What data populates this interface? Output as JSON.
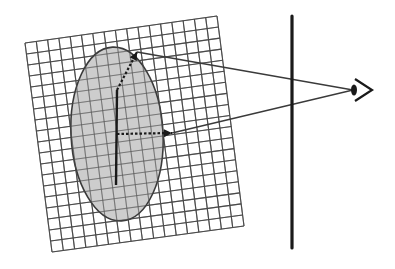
{
  "diagram": {
    "colors": {
      "background": "#ffffff",
      "grid_line": "#4a4a4a",
      "ellipse_fill": "#c4c4c4",
      "ellipse_stroke": "#3a3a3a",
      "ray": "#3a3a3a",
      "image_plane": "#1a1a1a",
      "arrow": "#1a1a1a"
    },
    "grid": {
      "corners": {
        "top_left": [
          25,
          43
        ],
        "top_right": [
          217,
          16
        ],
        "bottom_right": [
          244,
          226
        ],
        "bottom_left": [
          52,
          252
        ]
      },
      "columns": 17,
      "rows": 19
    },
    "ellipse": {
      "cx": 117,
      "cy": 134,
      "rx": 46,
      "ry": 87,
      "rotation": -3
    },
    "vertical_stem": {
      "x1": 116,
      "y1": 185,
      "x2": 117,
      "y2": 90
    },
    "upper_arrow": {
      "x1": 117,
      "y1": 90,
      "x2": 137,
      "y2": 52
    },
    "horizontal_arrow": {
      "x1": 117,
      "y1": 134,
      "x2": 172,
      "y2": 133
    },
    "image_plane": {
      "x": 292,
      "y1": 16,
      "y2": 248
    },
    "eye": {
      "x": 353,
      "y": 90
    },
    "rays": [
      {
        "from": [
          353,
          90
        ],
        "to": [
          137,
          52
        ]
      },
      {
        "from": [
          353,
          90
        ],
        "to": [
          172,
          133
        ]
      }
    ]
  }
}
